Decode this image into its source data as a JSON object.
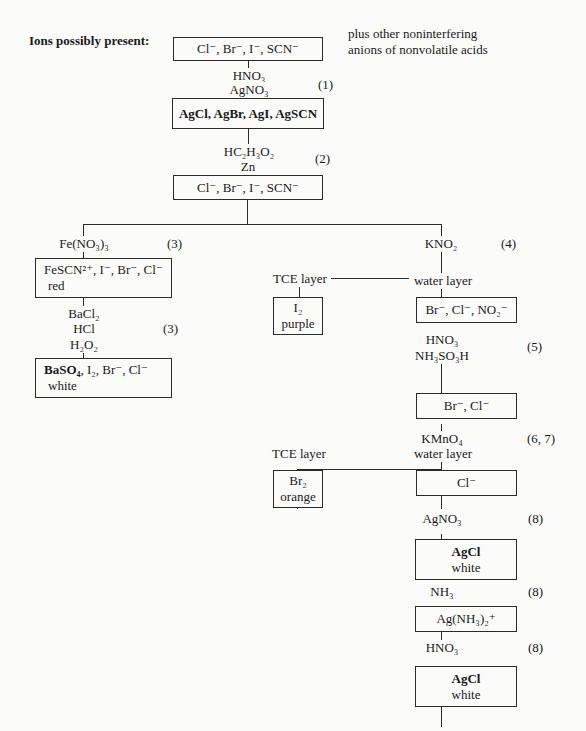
{
  "header": {
    "ions_label": "Ions possibly present:",
    "note_line1": "plus other noninterfering",
    "note_line2": "anions of nonvolatile acids"
  },
  "boxes": {
    "start": "Cl⁻, Br⁻, I⁻, SCN⁻",
    "precipitate": "AgCl, AgBr, AgI, AgSCN",
    "redissolved": "Cl⁻, Br⁻, I⁻, SCN⁻",
    "fescn_line1": "FeSCN²⁺, I⁻, Br⁻, Cl⁻",
    "fescn_line2": "red",
    "baso4_line1_bold": "BaSO₄",
    "baso4_line1_rest": ", I₂, Br⁻, Cl⁻",
    "baso4_line2": "white",
    "i2_line1": "I₂",
    "i2_line2": "purple",
    "br_cl_no2": "Br⁻, Cl⁻, NO₂⁻",
    "br_cl": "Br⁻, Cl⁻",
    "br2_line1": "Br₂",
    "br2_line2": "orange",
    "cl": "Cl⁻",
    "agcl1_line1": "AgCl",
    "agcl1_line2": "white",
    "complex": "Ag(NH₃)₂⁺",
    "agcl2_line1": "AgCl",
    "agcl2_line2": "white"
  },
  "reagents": {
    "step1_a": "HNO₃",
    "step1_b": "AgNO₃",
    "step1_num": "(1)",
    "step2_a": "HC₂H₃O₂",
    "step2_b": "Zn",
    "step2_num": "(2)",
    "fe_reagent": "Fe(NO₃)₃",
    "fe_num": "(3)",
    "kno2_reagent": "KNO₂",
    "kno2_num": "(4)",
    "ba_a": "BaCl₂",
    "ba_b": "HCl",
    "ba_c": "H₂O₂",
    "ba_num": "(3)",
    "tce_layer_1": "TCE layer",
    "water_layer_1": "water layer",
    "step5_a": "HNO₃",
    "step5_b": "NH₃SO₃H",
    "step5_num": "(5)",
    "kmno4": "KMnO₄",
    "kmno4_num": "(6, 7)",
    "tce_layer_2": "TCE layer",
    "water_layer_2": "water layer",
    "agno3": "AgNO₃",
    "agno3_num": "(8)",
    "nh3": "NH₃",
    "nh3_num": "(8)",
    "hno3": "HNO₃",
    "hno3_num": "(8)"
  }
}
